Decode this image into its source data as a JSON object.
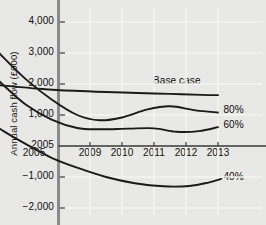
{
  "chart_data": {
    "type": "line",
    "title": "",
    "xlabel": "",
    "ylabel": "Annual cash flow (£000)",
    "ylim": [
      -2000,
      4500
    ],
    "xlim": [
      2005.7,
      2013.6
    ],
    "grid": true,
    "legend_position": "right-of-line-ends",
    "y_ticks": [
      4000,
      3000,
      2000,
      1000,
      0,
      -1000,
      -2000
    ],
    "y_tick_labels": [
      "4,000",
      "3,000",
      "2,000",
      "1,000",
      "2005",
      "−1,000",
      "−2,000"
    ],
    "x_ticks": [
      2005,
      2009,
      2010,
      2011,
      2012,
      2013
    ],
    "x_tick_labels": [
      "2005",
      "2009",
      "2010",
      "2011",
      "2012",
      "2013"
    ],
    "zero_line": 0,
    "series": [
      {
        "name": "Base case",
        "label": "Base case",
        "color": "#1a1a1a",
        "x": [
          2005.7,
          2006.5,
          2007.5,
          2008.5,
          2009.5,
          2010.5,
          2011.5,
          2012.5,
          2013.0
        ],
        "values": [
          2000,
          1930,
          1840,
          1780,
          1740,
          1710,
          1680,
          1650,
          1640
        ]
      },
      {
        "name": "80%",
        "label": "80%",
        "color": "#1a1a1a",
        "x": [
          2005.7,
          2006.3,
          2007.0,
          2007.8,
          2008.6,
          2009.3,
          2010.0,
          2010.8,
          2011.5,
          2012.3,
          2013.0
        ],
        "values": [
          3530,
          2850,
          2150,
          1500,
          1000,
          830,
          920,
          1180,
          1280,
          1150,
          1080
        ]
      },
      {
        "name": "60%",
        "label": "60%",
        "color": "#1a1a1a",
        "x": [
          2005.7,
          2006.3,
          2007.0,
          2007.8,
          2008.6,
          2009.3,
          2010.2,
          2011.0,
          2011.7,
          2012.4,
          2013.0
        ],
        "values": [
          2570,
          1960,
          1330,
          850,
          580,
          540,
          560,
          570,
          460,
          480,
          610
        ]
      },
      {
        "name": "40%",
        "label": "40%",
        "color": "#1a1a1a",
        "x": [
          2005.7,
          2006.3,
          2007.0,
          2007.8,
          2008.6,
          2009.5,
          2010.4,
          2011.3,
          2012.1,
          2012.7,
          2013.1
        ],
        "values": [
          900,
          480,
          60,
          -380,
          -700,
          -1000,
          -1200,
          -1300,
          -1290,
          -1180,
          -1060
        ]
      }
    ],
    "annotations": [
      {
        "text": "Base case",
        "x": 2011.0,
        "y": 2050
      },
      {
        "text": "80%",
        "x": 2013.2,
        "y": 1130
      },
      {
        "text": "60%",
        "x": 2013.2,
        "y": 630
      },
      {
        "text": "40%",
        "x": 2013.2,
        "y": -1030
      }
    ]
  },
  "colors": {
    "background": "#e8e8e6",
    "line": "#1a1a1a",
    "grid": "#f4f4f2",
    "axis": "#8a8a88",
    "text": "#100f0c"
  }
}
